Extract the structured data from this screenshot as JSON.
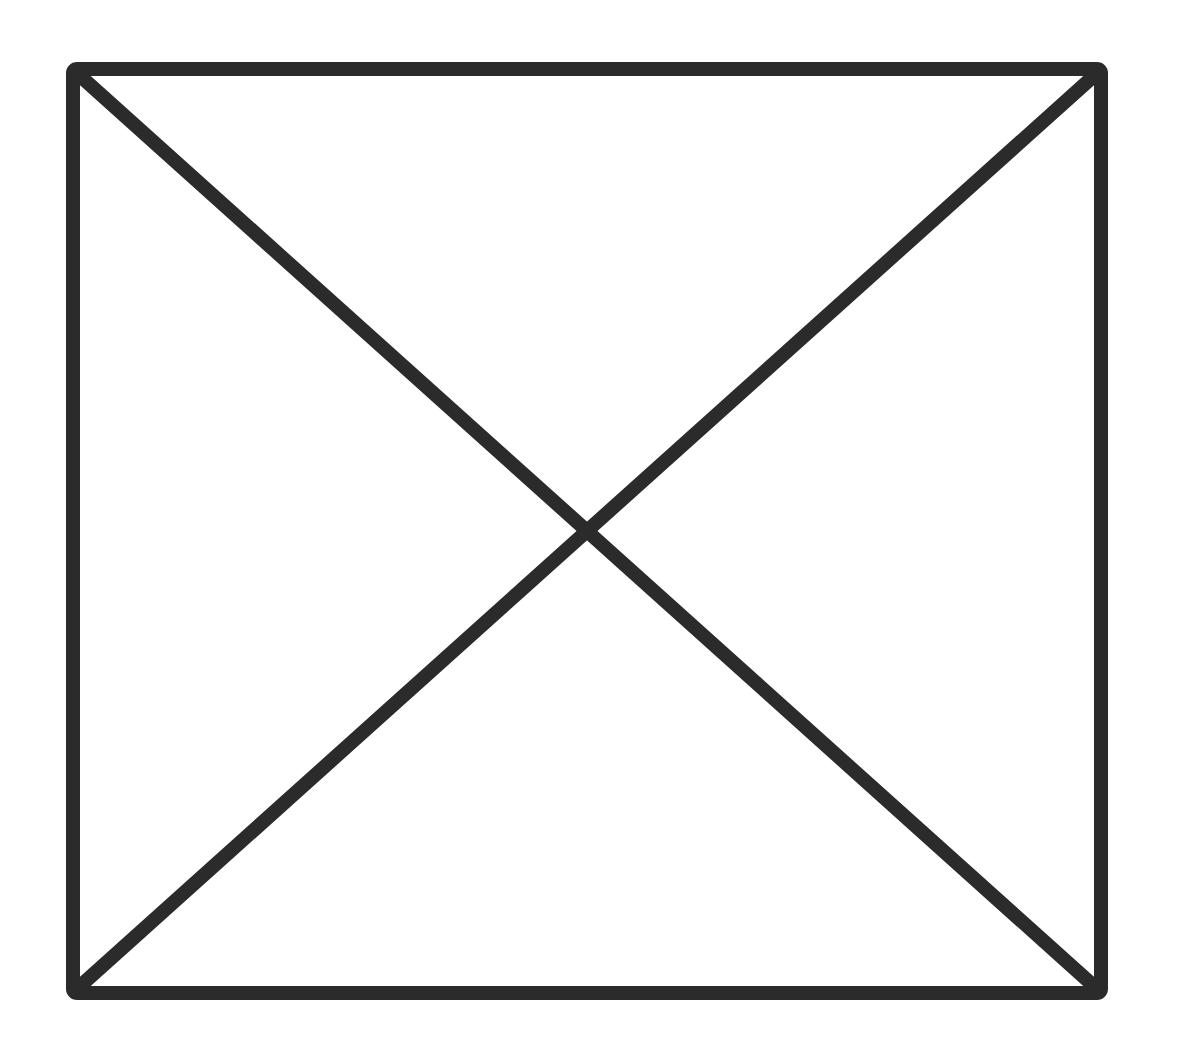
{
  "placeholder": {
    "label": "Image placeholder",
    "icon": "crossed-box-icon",
    "stroke_color": "#2b2b2b",
    "background_color": "#ffffff",
    "stroke_width": 14,
    "box": {
      "x1": 73,
      "y1": 69,
      "x2": 1101,
      "y2": 993
    }
  }
}
